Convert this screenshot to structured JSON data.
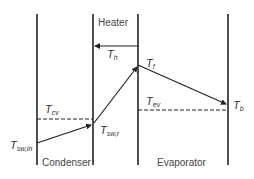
{
  "diagram": {
    "regions": {
      "heater": "Heater",
      "condenser": "Condenser",
      "evaporator": "Evaporator"
    },
    "symbols": {
      "t_h": {
        "base": "T",
        "sub": "h"
      },
      "t_f": {
        "base": "T",
        "sub": "f"
      },
      "t_cv": {
        "base": "T",
        "sub": "cv"
      },
      "t_sw_in": {
        "base": "T",
        "sub": "sw,in"
      },
      "t_sw_r": {
        "base": "T",
        "sub": "sw,r"
      },
      "t_ev": {
        "base": "T",
        "sub": "ev"
      },
      "t_b": {
        "base": "T",
        "sub": "b"
      }
    },
    "colors": {
      "line": "#222222",
      "text": "#333333"
    }
  }
}
